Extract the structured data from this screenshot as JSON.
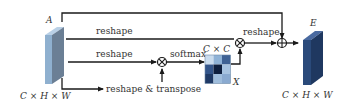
{
  "diagram": {
    "type": "channel-attention-module",
    "input_block": {
      "label": "A",
      "dims": "C × H × W",
      "color_front": "#8fb0cf",
      "color_side": "#6b7f95",
      "color_top": "#b9d0e6"
    },
    "output_block": {
      "label": "E",
      "dims": "C × H × W",
      "color_front": "#2a4a7a",
      "color_side": "#1f3860",
      "color_top": "#4a6aa0"
    },
    "edges": {
      "reshape_top": "reshape",
      "reshape_mid": "reshape",
      "reshape_transpose": "reshape & transpose",
      "softmax": "softmax",
      "reshape_out": "reshape"
    },
    "matrix": {
      "label_top": "C × C",
      "label_side": "X",
      "cells": [
        [
          "#c9dcee",
          "#8fb2d6",
          "#3f6294"
        ],
        [
          "#33558a",
          "#0e1f3e",
          "#a7c3e0"
        ],
        [
          "#1f3a66",
          "#9fbddc",
          "#8aaad0"
        ]
      ]
    },
    "operators": {
      "matmul_1": "⊗",
      "matmul_2": "⊗",
      "add": "⊕"
    },
    "line_color": "#1a1a1a"
  }
}
